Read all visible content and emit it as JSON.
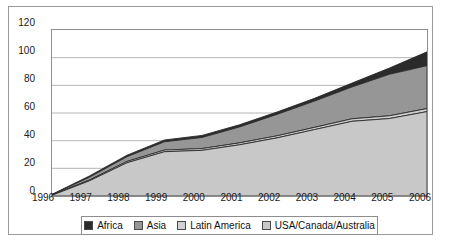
{
  "chart_data": {
    "type": "area",
    "stacked": true,
    "title": "",
    "subtitle": "",
    "xlabel": "",
    "ylabel": "",
    "categories": [
      "1996",
      "1997",
      "1998",
      "1999",
      "2000",
      "2001",
      "2002",
      "2003",
      "2004",
      "2005",
      "2006"
    ],
    "x": [
      1996,
      1997,
      1998,
      1999,
      2000,
      2001,
      2002,
      2003,
      2004,
      2005,
      2006
    ],
    "xlim": [
      1996,
      2006
    ],
    "ylim": [
      0,
      120
    ],
    "yticks": [
      0,
      20,
      40,
      60,
      80,
      100,
      120
    ],
    "ytick_labels": [
      "0",
      "20",
      "40",
      "60",
      "80",
      "100",
      "120"
    ],
    "xtick_labels": [
      "1996",
      "1997",
      "1998",
      "1999",
      "2000",
      "2001",
      "2002",
      "2003",
      "2004",
      "2005",
      "2006"
    ],
    "grid": "horizontal",
    "legend_position": "bottom",
    "series": [
      {
        "name": "USA/Canada/Australia",
        "color": "#c8c8c8",
        "stack_order": 1,
        "values": [
          0.5,
          11,
          24,
          32,
          33,
          37,
          42,
          48,
          54,
          56,
          61
        ]
      },
      {
        "name": "Latin America",
        "color": "#cfcfcf",
        "stack_order": 2,
        "values": [
          0.2,
          0.6,
          1.0,
          1.2,
          1.3,
          1.4,
          1.5,
          1.6,
          1.8,
          2.0,
          2.2
        ]
      },
      {
        "name": "Asia",
        "color": "#969696",
        "stack_order": 3,
        "values": [
          0.2,
          2.0,
          3.4,
          6.0,
          8.0,
          11.5,
          15.5,
          19.0,
          23.0,
          30.0,
          31.0
        ]
      },
      {
        "name": "Africa",
        "color": "#2b2b2b",
        "stack_order": 4,
        "values": [
          0.3,
          0.9,
          1.1,
          1.3,
          1.5,
          1.6,
          1.7,
          2.0,
          2.8,
          4.5,
          10.0
        ]
      }
    ],
    "cumulative_totals": [
      1.2,
      14.5,
      29.5,
      40.5,
      43.8,
      51.5,
      60.7,
      70.6,
      81.6,
      92.5,
      104.2
    ],
    "axis_line_color": "#8d8d8d",
    "gridline_color": "#b4b4b4",
    "background_color": "#ffffff",
    "frame_color": "#9a9a9a"
  },
  "legend": {
    "entries": [
      {
        "label": "Africa",
        "color": "#2b2b2b"
      },
      {
        "label": "Asia",
        "color": "#969696"
      },
      {
        "label": "Latin America",
        "color": "#d2d2d2"
      },
      {
        "label": "USA/Canada/Australia",
        "color": "#c8c8c8"
      }
    ]
  }
}
